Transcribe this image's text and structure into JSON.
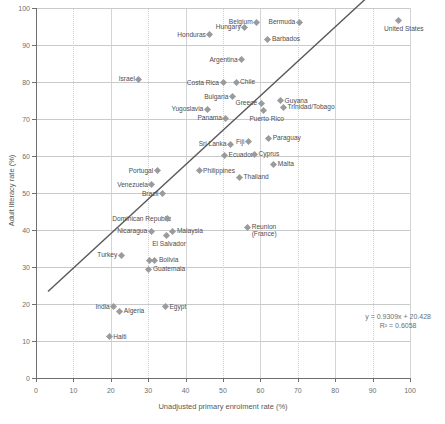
{
  "chart_data": {
    "type": "scatter",
    "title": "",
    "xlabel": "Unadjusted primary enrolment rate (%)",
    "ylabel": "Adult literacy rate (%)",
    "xlim": [
      0,
      100
    ],
    "ylim": [
      0,
      100
    ],
    "xticks": [
      0,
      10,
      20,
      30,
      40,
      50,
      60,
      70,
      80,
      90,
      100
    ],
    "yticks": [
      0,
      10,
      20,
      30,
      40,
      50,
      60,
      70,
      80,
      90,
      100
    ],
    "grid": true,
    "legend": "none",
    "trendline": {
      "equation": "y = 0.9309x + 20.428",
      "r2": "R² = 0.6058",
      "slope": 0.9309,
      "intercept": 20.428,
      "x_start": 3.2,
      "x_end": 94.6
    },
    "points": [
      {
        "label": "Honduras",
        "x": 46.5,
        "y": 92.8,
        "pos": "left"
      },
      {
        "label": "Belgium",
        "x": 59.0,
        "y": 96.2,
        "pos": "left"
      },
      {
        "label": "Hungary",
        "x": 55.8,
        "y": 94.8,
        "pos": "left"
      },
      {
        "label": "Bermuda",
        "x": 70.4,
        "y": 96.2,
        "pos": "left"
      },
      {
        "label": "United States",
        "x": 96.8,
        "y": 96.5,
        "pos": "below"
      },
      {
        "label": "Barbados",
        "x": 62.0,
        "y": 91.5,
        "pos": "right"
      },
      {
        "label": "Argentina",
        "x": 55.0,
        "y": 86.0,
        "pos": "left"
      },
      {
        "label": "Israel",
        "x": 27.5,
        "y": 80.8,
        "pos": "left"
      },
      {
        "label": "Costa Rica",
        "x": 50.0,
        "y": 79.8,
        "pos": "left"
      },
      {
        "label": "Chile",
        "x": 53.5,
        "y": 80.0,
        "pos": "right"
      },
      {
        "label": "Bulgaria",
        "x": 52.5,
        "y": 76.0,
        "pos": "left"
      },
      {
        "label": "Greece",
        "x": 60.2,
        "y": 74.2,
        "pos": "left"
      },
      {
        "label": "Guyana",
        "x": 65.4,
        "y": 75.0,
        "pos": "right"
      },
      {
        "label": "Trinidad/Tobago",
        "x": 66.2,
        "y": 73.2,
        "pos": "right"
      },
      {
        "label": "Yugoslavia",
        "x": 45.8,
        "y": 72.6,
        "pos": "left"
      },
      {
        "label": "Puerto Rico",
        "x": 60.8,
        "y": 72.2,
        "pos": "below"
      },
      {
        "label": "Panama",
        "x": 50.8,
        "y": 70.2,
        "pos": "left"
      },
      {
        "label": "Sri Lanka",
        "x": 52.0,
        "y": 63.2,
        "pos": "left"
      },
      {
        "label": "Fiji",
        "x": 56.8,
        "y": 63.8,
        "pos": "left"
      },
      {
        "label": "Paraguay",
        "x": 62.2,
        "y": 64.8,
        "pos": "right"
      },
      {
        "label": "Ecuador",
        "x": 50.4,
        "y": 60.2,
        "pos": "right"
      },
      {
        "label": "Cyprus",
        "x": 58.4,
        "y": 60.5,
        "pos": "right"
      },
      {
        "label": "Malta",
        "x": 63.6,
        "y": 57.8,
        "pos": "right"
      },
      {
        "label": "Philippines",
        "x": 43.6,
        "y": 56.0,
        "pos": "right"
      },
      {
        "label": "Portugal",
        "x": 32.4,
        "y": 56.0,
        "pos": "left"
      },
      {
        "label": "Venezuela",
        "x": 31.0,
        "y": 52.2,
        "pos": "left"
      },
      {
        "label": "Thailand",
        "x": 54.4,
        "y": 54.2,
        "pos": "right"
      },
      {
        "label": "Brazil",
        "x": 33.8,
        "y": 49.8,
        "pos": "left"
      },
      {
        "label": "Dominican Republic",
        "x": 27.0,
        "y": 43.0,
        "pos": "labelonly"
      },
      {
        "label": "",
        "x": 35.2,
        "y": 43.2,
        "pos": "none"
      },
      {
        "label": "Nicaragua",
        "x": 30.8,
        "y": 39.6,
        "pos": "left"
      },
      {
        "label": "Malaysia",
        "x": 36.6,
        "y": 39.6,
        "pos": "right"
      },
      {
        "label": "El Salvador",
        "x": 34.8,
        "y": 38.4,
        "pos": "below"
      },
      {
        "label": "Reunion\n(France)",
        "x": 56.6,
        "y": 40.8,
        "pos": "right"
      },
      {
        "label": "Turkey",
        "x": 22.8,
        "y": 33.2,
        "pos": "left"
      },
      {
        "label": "Bolivia",
        "x": 31.8,
        "y": 31.8,
        "pos": "right"
      },
      {
        "label": "",
        "x": 30.4,
        "y": 31.8,
        "pos": "none"
      },
      {
        "label": "Guatemala",
        "x": 30.2,
        "y": 29.4,
        "pos": "right"
      },
      {
        "label": "India",
        "x": 20.8,
        "y": 19.2,
        "pos": "left"
      },
      {
        "label": "Algeria",
        "x": 22.4,
        "y": 18.0,
        "pos": "right"
      },
      {
        "label": "Egypt",
        "x": 34.6,
        "y": 19.2,
        "pos": "right"
      },
      {
        "label": "Haiti",
        "x": 19.6,
        "y": 11.2,
        "pos": "right"
      }
    ]
  },
  "colors": {
    "point": "#9a9b9d",
    "text": "#4d4e50",
    "axis": "#6e6f71",
    "grid": "#c9cacb",
    "trendline": "#58585a"
  }
}
